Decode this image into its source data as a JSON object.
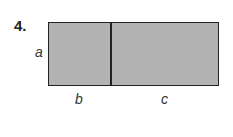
{
  "problem": {
    "number": "4."
  },
  "figure": {
    "fill_color": "#b3b3b3",
    "stroke_color": "#222222",
    "labels": {
      "height": "a",
      "left_width": "b",
      "right_width": "c"
    }
  }
}
